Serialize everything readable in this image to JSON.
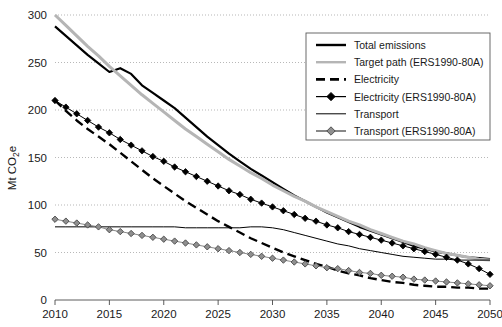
{
  "chart_data": {
    "type": "line",
    "title": "",
    "xlabel": "",
    "ylabel": "Mt CO2e",
    "ylabel_display": "Mt CO",
    "ylabel_sub": "2",
    "ylabel_tail": "e",
    "xlim": [
      2010,
      2050
    ],
    "ylim": [
      0,
      300
    ],
    "grid": true,
    "legend_position": "top-right",
    "x_ticks": [
      2010,
      2015,
      2020,
      2025,
      2030,
      2035,
      2040,
      2045,
      2050
    ],
    "y_ticks": [
      0,
      50,
      100,
      150,
      200,
      250,
      300
    ],
    "x": [
      2010,
      2011,
      2012,
      2013,
      2014,
      2015,
      2016,
      2017,
      2018,
      2019,
      2020,
      2021,
      2022,
      2023,
      2024,
      2025,
      2026,
      2027,
      2028,
      2029,
      2030,
      2031,
      2032,
      2033,
      2034,
      2035,
      2036,
      2037,
      2038,
      2039,
      2040,
      2041,
      2042,
      2043,
      2044,
      2045,
      2046,
      2047,
      2048,
      2049,
      2050
    ],
    "series": [
      {
        "name": "Total emissions",
        "style": "solid-thick-black",
        "color": "#000000",
        "width": 2.2,
        "marker": "none",
        "values": [
          288,
          278,
          268,
          258,
          249,
          240,
          244,
          238,
          226,
          218,
          210,
          202,
          192,
          182,
          172,
          163,
          154,
          146,
          138,
          131,
          124,
          117,
          110,
          104,
          98,
          92,
          87,
          82,
          77,
          73,
          69,
          65,
          61,
          57,
          54,
          51,
          49,
          47,
          45,
          44,
          43
        ]
      },
      {
        "name": "Target path (ERS1990-80A)",
        "style": "solid-thick-gray",
        "color": "#b5b5b5",
        "width": 3.0,
        "marker": "none",
        "values": [
          300,
          289,
          278,
          267,
          257,
          246,
          236,
          226,
          216,
          207,
          198,
          189,
          180,
          172,
          164,
          156,
          148,
          141,
          134,
          128,
          121,
          115,
          109,
          104,
          98,
          93,
          88,
          83,
          79,
          74,
          70,
          66,
          62,
          59,
          55,
          52,
          49,
          47,
          45,
          43,
          42
        ]
      },
      {
        "name": "Electricity",
        "style": "dashed-black",
        "color": "#000000",
        "width": 2.4,
        "dash": "9 5",
        "marker": "none",
        "values": [
          210,
          199,
          189,
          180,
          172,
          164,
          155,
          146,
          137,
          128,
          120,
          112,
          104,
          97,
          90,
          83,
          77,
          71,
          65,
          60,
          55,
          50,
          46,
          42,
          38,
          35,
          31,
          28,
          26,
          23,
          21,
          19,
          18,
          16,
          15,
          14,
          14,
          13,
          13,
          12,
          12
        ]
      },
      {
        "name": "Electricity (ERS1990-80A)",
        "style": "solid-black-diamond",
        "color": "#000000",
        "width": 1.0,
        "marker": "diamond-black",
        "values": [
          210,
          203,
          196,
          189,
          182,
          176,
          169,
          163,
          157,
          151,
          146,
          140,
          135,
          130,
          125,
          120,
          115,
          111,
          106,
          102,
          98,
          94,
          90,
          86,
          83,
          79,
          76,
          72,
          69,
          66,
          63,
          60,
          57,
          54,
          51,
          48,
          45,
          42,
          38,
          33,
          27
        ]
      },
      {
        "name": "Transport",
        "style": "solid-thin-black",
        "color": "#000000",
        "width": 1.0,
        "marker": "none",
        "values": [
          77,
          77,
          77,
          77,
          77,
          77,
          77,
          77,
          77,
          77,
          77,
          77,
          76,
          76,
          76,
          76,
          76,
          76,
          77,
          77,
          76,
          74,
          71,
          68,
          65,
          62,
          59,
          57,
          54,
          52,
          50,
          48,
          46,
          45,
          44,
          43,
          43,
          42,
          42,
          42,
          42
        ]
      },
      {
        "name": "Transport (ERS1990-80A)",
        "style": "solid-gray-diamond",
        "color": "#8a8a8a",
        "width": 1.0,
        "marker": "diamond-gray",
        "values": [
          85,
          83,
          81,
          79,
          77,
          74,
          72,
          70,
          68,
          66,
          64,
          62,
          60,
          58,
          56,
          54,
          52,
          50,
          48,
          46,
          44,
          42,
          40,
          38,
          36,
          34,
          33,
          31,
          29,
          28,
          26,
          25,
          24,
          22,
          21,
          20,
          19,
          18,
          17,
          16,
          15
        ]
      }
    ],
    "legend_entries": [
      {
        "label": "Total emissions",
        "swatch": "solid-thick-black"
      },
      {
        "label": "Target path (ERS1990-80A)",
        "swatch": "solid-thick-gray"
      },
      {
        "label": "Electricity",
        "swatch": "dashed-black"
      },
      {
        "label": "Electricity (ERS1990-80A)",
        "swatch": "solid-black-diamond"
      },
      {
        "label": "Transport",
        "swatch": "solid-thin-black"
      },
      {
        "label": "Transport (ERS1990-80A)",
        "swatch": "solid-gray-diamond"
      }
    ]
  },
  "colors": {
    "black": "#000000",
    "target_gray": "#b5b5b5",
    "transport_gray": "#8a8a8a",
    "grid": "#9a9a9a",
    "axis": "#4a4a4a"
  }
}
